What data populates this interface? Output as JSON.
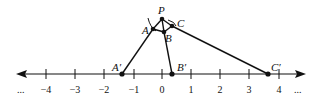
{
  "diagram": {
    "type": "projection-onto-number-line",
    "number_line": {
      "ticks": [
        {
          "value": -4,
          "label": "−4",
          "x": 46
        },
        {
          "value": -3,
          "label": "−3",
          "x": 75
        },
        {
          "value": -2,
          "label": "−2",
          "x": 104
        },
        {
          "value": -1,
          "label": "−1",
          "x": 134
        },
        {
          "value": 0,
          "label": "0",
          "x": 162
        },
        {
          "value": 1,
          "label": "1",
          "x": 191
        },
        {
          "value": 2,
          "label": "2",
          "x": 220
        },
        {
          "value": 3,
          "label": "3",
          "x": 249
        },
        {
          "value": 4,
          "label": "4",
          "x": 279
        }
      ],
      "left_ellipsis": "...",
      "right_ellipsis": "...",
      "arrows": "both"
    },
    "points": {
      "P": {
        "label": "P",
        "x": 162,
        "y": 19
      },
      "A": {
        "label": "A",
        "x": 153,
        "y": 29
      },
      "B": {
        "label": "B",
        "x": 164,
        "y": 32
      },
      "C": {
        "label": "C",
        "x": 172,
        "y": 26
      },
      "A_prime": {
        "label": "A′",
        "x": 122,
        "y": 74,
        "approx_value": -1.4
      },
      "B_prime": {
        "label": "B′",
        "x": 172,
        "y": 74,
        "approx_value": 0.35
      },
      "C_prime": {
        "label": "C′",
        "x": 268,
        "y": 74,
        "approx_value": 3.65
      }
    },
    "colors": {
      "stroke": "#111111",
      "background": "#ffffff"
    }
  }
}
